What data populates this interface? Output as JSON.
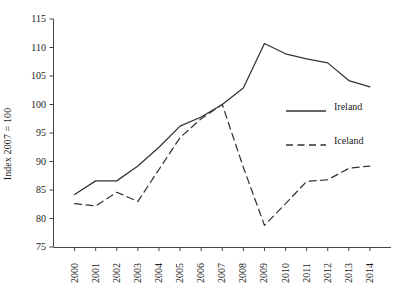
{
  "chart_data": {
    "type": "line",
    "title": "",
    "xlabel": "",
    "ylabel": "Index 2007 = 100",
    "ylim": [
      75,
      115
    ],
    "yticks": [
      75,
      80,
      85,
      90,
      95,
      100,
      105,
      110,
      115
    ],
    "grid": false,
    "legend_position": "center-right",
    "categories": [
      "2000",
      "2001",
      "2002",
      "2003",
      "2004",
      "2005",
      "2006",
      "2007",
      "2008",
      "2009",
      "2010",
      "2011",
      "2012",
      "2013",
      "2014"
    ],
    "x": [
      2000,
      2001,
      2002,
      2003,
      2004,
      2005,
      2006,
      2007,
      2008,
      2009,
      2010,
      2011,
      2012,
      2013,
      2014
    ],
    "series": [
      {
        "name": "Ireland",
        "style": "solid",
        "color": "#333333",
        "values": [
          84.2,
          86.6,
          86.6,
          89.2,
          92.5,
          96.2,
          97.8,
          100.0,
          102.9,
          110.7,
          108.9,
          108.0,
          107.3,
          104.2,
          103.1
        ]
      },
      {
        "name": "Iceland",
        "style": "dashed",
        "color": "#333333",
        "values": [
          82.6,
          82.2,
          84.6,
          83.0,
          88.6,
          94.2,
          97.5,
          100.0,
          89.0,
          78.8,
          82.6,
          86.5,
          86.8,
          88.8,
          89.2
        ]
      }
    ]
  },
  "axes": {
    "y_tick_labels": [
      "115",
      "110",
      "105",
      "100",
      "95",
      "90",
      "85",
      "80",
      "75"
    ],
    "x_tick_labels": [
      "2000",
      "2001",
      "2002",
      "2003",
      "2004",
      "2005",
      "2006",
      "2007",
      "2008",
      "2009",
      "2010",
      "2011",
      "2012",
      "2013",
      "2014"
    ],
    "y_title": "Index 2007 = 100"
  },
  "legend": {
    "items": [
      {
        "label": "Ireland",
        "style": "solid"
      },
      {
        "label": "Iceland",
        "style": "dashed"
      }
    ]
  }
}
